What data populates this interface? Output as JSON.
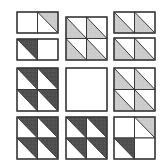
{
  "diagram": {
    "title": "",
    "width": 164,
    "height": 164,
    "colors": {
      "background": "#ffffff",
      "outline": "#3a3a3a",
      "light": "#c8c8c8",
      "dark": "#4a4a4a",
      "white": "#ffffff"
    },
    "unit_note": "Each square unit is split by a diagonal from top-left to bottom-right; 'tr' = upper-right triangle filled, 'bl' = lower-left triangle filled",
    "pieces": [
      {
        "name": "r1c1-top-rect",
        "x": 17,
        "y": 12,
        "w": 41,
        "h": 21,
        "cols": 2,
        "rows": 1,
        "units": [
          {
            "fill": "none"
          },
          {
            "fill": "light",
            "tri": "tr"
          }
        ]
      },
      {
        "name": "r1c1-bottom-rect",
        "x": 17,
        "y": 39,
        "w": 41,
        "h": 21,
        "cols": 2,
        "rows": 1,
        "units": [
          {
            "fill": "dark",
            "tri": "tr-inv"
          },
          {
            "fill": "none"
          }
        ]
      },
      {
        "name": "r1c2-block",
        "x": 66,
        "y": 17,
        "w": 41,
        "h": 43,
        "cols": 2,
        "rows": 2,
        "units": [
          {
            "fill": "light",
            "tri": "bl"
          },
          {
            "fill": "light",
            "tri": "bl"
          },
          {
            "fill": "light",
            "tri": "bl"
          },
          {
            "fill": "light",
            "tri": "bl"
          }
        ]
      },
      {
        "name": "r1c3-top-rect",
        "x": 114,
        "y": 12,
        "w": 41,
        "h": 21,
        "cols": 2,
        "rows": 1,
        "units": [
          {
            "fill": "light",
            "tri": "bl"
          },
          {
            "fill": "light",
            "tri": "bl"
          }
        ]
      },
      {
        "name": "r1c3-bottom-rect",
        "x": 114,
        "y": 38,
        "w": 41,
        "h": 22,
        "cols": 2,
        "rows": 1,
        "units": [
          {
            "fill": "light",
            "tri": "bl"
          },
          {
            "fill": "light",
            "tri": "bl"
          }
        ]
      },
      {
        "name": "r2c1-block",
        "x": 17,
        "y": 68,
        "w": 41,
        "h": 43,
        "cols": 2,
        "rows": 2,
        "units": [
          {
            "fill": "dark",
            "tri": "tr"
          },
          {
            "fill": "dark",
            "tri": "tr"
          },
          {
            "fill": "dark",
            "tri": "tr"
          },
          {
            "fill": "dark",
            "tri": "tr"
          }
        ]
      },
      {
        "name": "r2c2-plain-square",
        "x": 66,
        "y": 68,
        "w": 41,
        "h": 43,
        "cols": 1,
        "rows": 1,
        "units": [
          {
            "fill": "none"
          }
        ]
      },
      {
        "name": "r2c3-block",
        "x": 114,
        "y": 68,
        "w": 41,
        "h": 43,
        "cols": 2,
        "rows": 2,
        "units": [
          {
            "fill": "light",
            "tri": "bl"
          },
          {
            "fill": "light",
            "tri": "bl"
          },
          {
            "fill": "light",
            "tri": "bl"
          },
          {
            "fill": "light",
            "tri": "bl"
          }
        ]
      },
      {
        "name": "r3c1-block",
        "x": 17,
        "y": 117,
        "w": 41,
        "h": 42,
        "cols": 2,
        "rows": 2,
        "units": [
          {
            "fill": "dark",
            "tri": "tr"
          },
          {
            "fill": "dark",
            "tri": "tr"
          },
          {
            "fill": "dark",
            "tri": "tr"
          },
          {
            "fill": "dark",
            "tri": "tr"
          }
        ]
      },
      {
        "name": "r3c2-block",
        "x": 66,
        "y": 117,
        "w": 41,
        "h": 42,
        "cols": 2,
        "rows": 2,
        "units": [
          {
            "fill": "dark",
            "tri": "tr"
          },
          {
            "fill": "dark",
            "tri": "tr"
          },
          {
            "fill": "dark",
            "tri": "tr"
          },
          {
            "fill": "dark",
            "tri": "tr"
          }
        ]
      },
      {
        "name": "r3c3-block",
        "x": 114,
        "y": 117,
        "w": 41,
        "h": 42,
        "cols": 2,
        "rows": 2,
        "units": [
          {
            "fill": "none"
          },
          {
            "fill": "light",
            "tri": "tr"
          },
          {
            "fill": "dark",
            "tri": "tr-inv"
          },
          {
            "fill": "none"
          }
        ]
      }
    ]
  }
}
